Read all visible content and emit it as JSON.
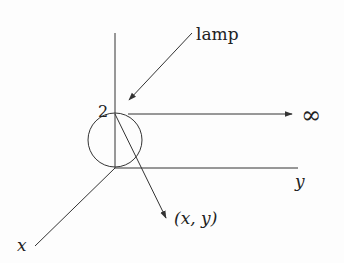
{
  "diagram": {
    "labels": {
      "lamp": "lamp",
      "height": "2",
      "infinity": "∞",
      "point": "(x, y)",
      "y_axis": "y",
      "x_axis": "x"
    },
    "colors": {
      "stroke": "#333333",
      "text": "#222222"
    }
  }
}
